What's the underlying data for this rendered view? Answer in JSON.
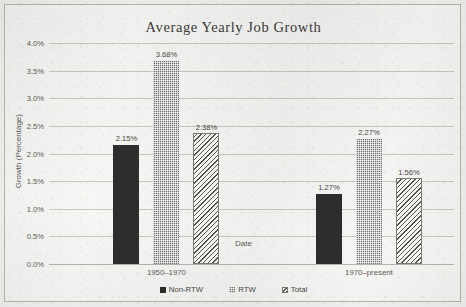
{
  "chart_data": {
    "type": "bar",
    "title": "Average Yearly Job Growth",
    "xlabel": "Date",
    "ylabel": "Growth (Percentage)",
    "categories": [
      "1950–1970",
      "1970–present"
    ],
    "series": [
      {
        "name": "Non-RTW",
        "values": [
          2.15,
          1.27
        ],
        "labels": [
          "2.15%",
          "1.27%"
        ],
        "pattern": "solid-dark",
        "color": "#2e2d2c"
      },
      {
        "name": "RTW",
        "values": [
          3.68,
          2.27
        ],
        "labels": [
          "3.68%",
          "2.27%"
        ],
        "pattern": "checkered",
        "color": "#6f6d6a"
      },
      {
        "name": "Total",
        "values": [
          2.38,
          1.56
        ],
        "labels": [
          "2.38%",
          "1.56%"
        ],
        "pattern": "diagonal-hatch",
        "color": "#56544f"
      }
    ],
    "ylim": [
      0,
      4.0
    ],
    "ytick_labels": [
      "0.0%",
      "0.5%",
      "1.0%",
      "1.5%",
      "2.0%",
      "2.5%",
      "3.0%",
      "3.5%",
      "4.0%"
    ],
    "ytick_values": [
      0,
      0.5,
      1.0,
      1.5,
      2.0,
      2.5,
      3.0,
      3.5,
      4.0
    ],
    "grid": true,
    "legend_position": "bottom",
    "unit": "%"
  },
  "legend": {
    "items": [
      {
        "label": "Non-RTW"
      },
      {
        "label": "RTW"
      },
      {
        "label": "Total"
      }
    ]
  }
}
